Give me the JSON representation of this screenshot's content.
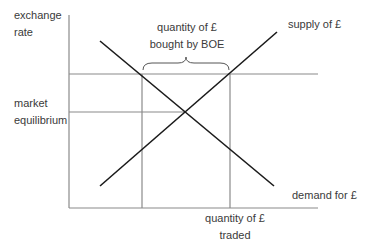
{
  "diagram": {
    "y_axis_label": [
      "exchange",
      "rate"
    ],
    "x_axis_label": [
      "quantity of £",
      "traded"
    ],
    "equilibrium_label": [
      "market",
      "equilibrium"
    ],
    "supply_label": "supply of £",
    "demand_label": "demand for £",
    "brace_label": [
      "quantity of £",
      "bought by BOE"
    ],
    "colors": {
      "curve": "#1a1a1a",
      "guide": "#8a8a8a",
      "text": "#3a3a3a"
    }
  }
}
